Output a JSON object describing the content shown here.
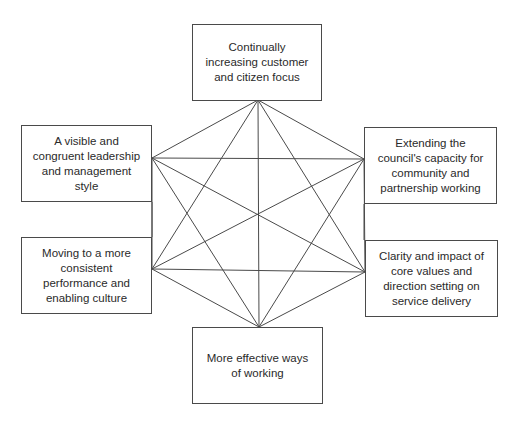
{
  "diagram": {
    "type": "hexagonal-interconnection",
    "line_color": "#4a4a4a",
    "nodes": [
      {
        "id": "top",
        "label": "Continually increasing customer and citizen focus",
        "box": [
          192,
          24,
          130,
          77
        ],
        "anchor": [
          258,
          100
        ]
      },
      {
        "id": "left-top",
        "label": "A visible and congruent leadership and management style",
        "box": [
          21,
          125,
          131,
          77
        ],
        "anchor": [
          152,
          158
        ]
      },
      {
        "id": "right-top",
        "label": "Extending the council's capacity for community and partnership working",
        "box": [
          364,
          127,
          133,
          77
        ],
        "anchor": [
          364,
          159
        ]
      },
      {
        "id": "left-bottom",
        "label": "Moving to a more consistent performance and enabling culture",
        "box": [
          21,
          237,
          131,
          77
        ],
        "anchor": [
          152,
          269
        ]
      },
      {
        "id": "right-bottom",
        "label": "Clarity and impact of core values and direction setting on service delivery",
        "box": [
          365,
          240,
          133,
          77
        ],
        "anchor": [
          365,
          272
        ]
      },
      {
        "id": "bottom",
        "label": "More effective ways of working",
        "box": [
          192,
          327,
          131,
          77
        ],
        "anchor": [
          259,
          327
        ]
      }
    ],
    "side_connectors": [
      {
        "from": "left-top",
        "to": "left-bottom",
        "x": 152,
        "y1": 202,
        "y2": 237
      },
      {
        "from": "right-top",
        "to": "right-bottom",
        "x": 364,
        "y1": 204,
        "y2": 240
      }
    ],
    "edges": "all-pairs"
  }
}
